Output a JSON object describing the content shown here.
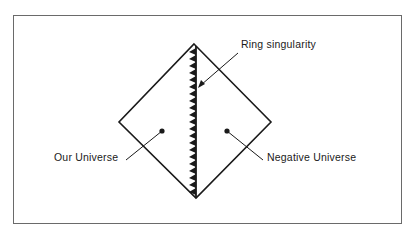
{
  "diagram": {
    "title": "",
    "type": "Penrose diagram",
    "labels": {
      "ring_singularity": "Ring singularity",
      "our_universe": "Our Universe",
      "negative_universe": "Negative Universe"
    },
    "colors": {
      "line": "#1a1a1a",
      "frame": "#6a6a6a",
      "background": "#ffffff"
    }
  }
}
